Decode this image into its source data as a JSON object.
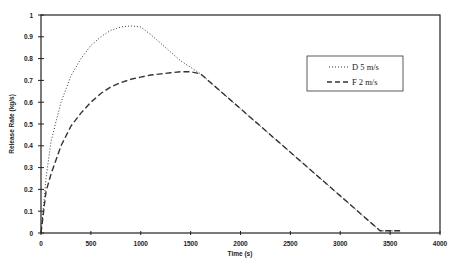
{
  "chart_data": {
    "type": "line",
    "title": "",
    "xlabel": "Time (s)",
    "ylabel": "Release Rate (kg/s)",
    "xlim": [
      0,
      4000
    ],
    "ylim": [
      0,
      1
    ],
    "xticks": [
      0,
      500,
      1000,
      1500,
      2000,
      2500,
      3000,
      3500,
      4000
    ],
    "yticks": [
      0,
      0.1,
      0.2,
      0.3,
      0.4,
      0.5,
      0.6,
      0.7,
      0.8,
      0.9,
      1
    ],
    "grid": false,
    "legend_position": "upper right (inside)",
    "series": [
      {
        "name": "D 5 m/s",
        "style": "dotted",
        "x": [
          0,
          50,
          100,
          200,
          300,
          400,
          500,
          600,
          700,
          800,
          900,
          1000,
          1100,
          1200,
          1300,
          1400,
          1500,
          1600,
          2000,
          2500,
          3000,
          3400,
          3600
        ],
        "y": [
          0.0,
          0.25,
          0.42,
          0.6,
          0.72,
          0.8,
          0.86,
          0.9,
          0.93,
          0.945,
          0.95,
          0.945,
          0.91,
          0.87,
          0.83,
          0.79,
          0.76,
          0.73,
          0.57,
          0.37,
          0.17,
          0.01,
          0.01
        ]
      },
      {
        "name": "F 2 m/s",
        "style": "dashed",
        "x": [
          0,
          50,
          100,
          200,
          300,
          400,
          500,
          600,
          700,
          800,
          900,
          1000,
          1100,
          1200,
          1300,
          1400,
          1500,
          1600,
          2000,
          2500,
          3000,
          3400,
          3600
        ],
        "y": [
          0.0,
          0.19,
          0.27,
          0.4,
          0.49,
          0.55,
          0.6,
          0.64,
          0.67,
          0.69,
          0.705,
          0.715,
          0.725,
          0.73,
          0.735,
          0.74,
          0.74,
          0.73,
          0.57,
          0.37,
          0.17,
          0.01,
          0.01
        ]
      }
    ]
  },
  "legend": {
    "items": [
      {
        "label": "D 5 m/s",
        "style": "dotted"
      },
      {
        "label": "F 2 m/s",
        "style": "dashed"
      }
    ]
  },
  "axes": {
    "x_title": "Time (s)",
    "y_title": "Release Rate (kg/s)",
    "x_tick_labels": [
      "0",
      "500",
      "1000",
      "1500",
      "2000",
      "2500",
      "3000",
      "3500",
      "4000"
    ],
    "y_tick_labels": [
      "0",
      "0.1",
      "0.2",
      "0.3",
      "0.4",
      "0.5",
      "0.6",
      "0.7",
      "0.8",
      "0.9",
      "1"
    ]
  }
}
